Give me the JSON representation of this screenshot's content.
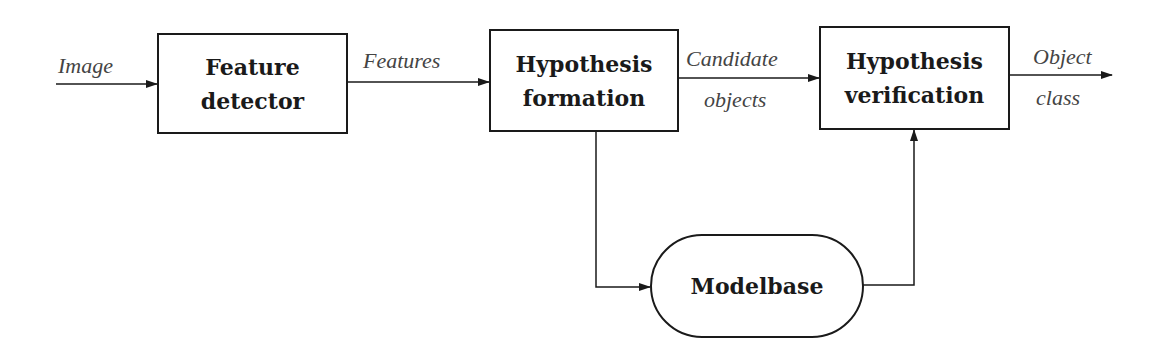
{
  "diagram": {
    "type": "flowchart",
    "nodes": [
      {
        "id": "feature_detector",
        "line1": "Feature",
        "line2": "detector",
        "shape": "rectangle"
      },
      {
        "id": "hypothesis_formation",
        "line1": "Hypothesis",
        "line2": "formation",
        "shape": "rectangle"
      },
      {
        "id": "hypothesis_verification",
        "line1": "Hypothesis",
        "line2": "verification",
        "shape": "rectangle"
      },
      {
        "id": "modelbase",
        "label": "Modelbase",
        "shape": "rounded-capsule"
      }
    ],
    "edges": [
      {
        "from": "input",
        "to": "feature_detector",
        "label": "Image"
      },
      {
        "from": "feature_detector",
        "to": "hypothesis_formation",
        "label": "Features"
      },
      {
        "from": "hypothesis_formation",
        "to": "hypothesis_verification",
        "label_line1": "Candidate",
        "label_line2": "objects"
      },
      {
        "from": "hypothesis_verification",
        "to": "output",
        "label_line1": "Object",
        "label_line2": "class"
      },
      {
        "from": "hypothesis_formation",
        "to": "modelbase",
        "label": ""
      },
      {
        "from": "modelbase",
        "to": "hypothesis_verification",
        "label": ""
      }
    ]
  },
  "colors": {
    "stroke": "#1a1a1a",
    "label_text": "#444444",
    "background": "#ffffff"
  }
}
